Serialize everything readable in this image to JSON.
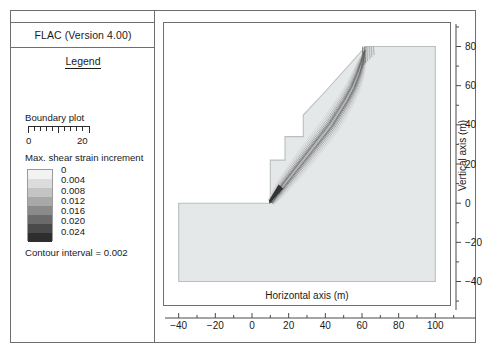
{
  "window": {
    "title": "FLAC (Version 4.00)"
  },
  "legend": {
    "heading": "Legend",
    "boundary_plot_label": "Boundary plot",
    "scale_min": "0",
    "scale_max": "20",
    "contour_title": "Max. shear strain increment",
    "contour_values": [
      "0",
      "0.004",
      "0.008",
      "0.012",
      "0.016",
      "0.020",
      "0.024"
    ],
    "contour_swatch_colors": [
      "#f2f2f2",
      "#dcdcdc",
      "#c4c4c4",
      "#a8a8a8",
      "#8a8a8a",
      "#6a6a6a",
      "#4a4a4a",
      "#2e2e2e"
    ],
    "contour_interval_label": "Contour interval = 0.002"
  },
  "chart_data": {
    "type": "contour",
    "title": "",
    "xlabel": "Horizontal axis (m)",
    "ylabel": "Vertical axis (m)",
    "xlim": [
      -48,
      108
    ],
    "ylim": [
      -52,
      92
    ],
    "xticks": [
      -40,
      -20,
      0,
      20,
      40,
      60,
      80,
      100
    ],
    "xtick_labels": [
      "−40",
      "−20",
      "0",
      "20",
      "40",
      "60",
      "80",
      "100"
    ],
    "xminor_step": 10,
    "yticks": [
      -40,
      -20,
      0,
      20,
      40,
      60,
      80
    ],
    "ytick_labels": [
      "−40",
      "−20",
      "0",
      "20",
      "40",
      "60",
      "80"
    ],
    "yminor_step": 10,
    "grid": false,
    "legend_position": "left-panel",
    "series": [
      {
        "name": "model boundary",
        "type": "polygon",
        "fill": "#e4e8e9",
        "stroke": "#b9bfc1",
        "points": [
          [
            -40,
            -40
          ],
          [
            100,
            -40
          ],
          [
            100,
            80
          ],
          [
            62,
            80
          ],
          [
            40,
            57
          ],
          [
            28,
            45
          ],
          [
            28,
            34
          ],
          [
            18,
            34
          ],
          [
            18,
            22
          ],
          [
            10,
            22
          ],
          [
            10,
            0
          ],
          [
            -40,
            0
          ]
        ]
      },
      {
        "name": "max shear strain increment contours",
        "type": "contour_band",
        "description": "Curved shear band from slope toe near (10,0) arcing up through the slope to the crest near (62,80), with vertical tension-crack contours at the crest",
        "levels": [
          0,
          0.004,
          0.008,
          0.012,
          0.016,
          0.02,
          0.024
        ],
        "peak_location": [
          11,
          1
        ],
        "peak_value": 0.024
      }
    ]
  }
}
